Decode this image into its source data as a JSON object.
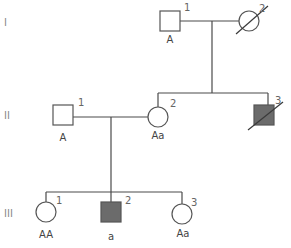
{
  "diagram": {
    "type": "pedigree",
    "generations": [
      {
        "label": "I",
        "members": [
          {
            "number": "1",
            "sex": "male",
            "affected": false,
            "deceased": false,
            "genotype": "A"
          },
          {
            "number": "2",
            "sex": "female",
            "affected": false,
            "deceased": true,
            "genotype": ""
          }
        ]
      },
      {
        "label": "II",
        "members": [
          {
            "number": "1",
            "sex": "male",
            "affected": false,
            "deceased": false,
            "genotype": "A"
          },
          {
            "number": "2",
            "sex": "female",
            "affected": false,
            "deceased": false,
            "genotype": "Aa"
          },
          {
            "number": "3",
            "sex": "male",
            "affected": true,
            "deceased": true,
            "genotype": ""
          }
        ]
      },
      {
        "label": "III",
        "members": [
          {
            "number": "1",
            "sex": "female",
            "affected": false,
            "deceased": false,
            "genotype": "AA"
          },
          {
            "number": "2",
            "sex": "male",
            "affected": true,
            "deceased": false,
            "genotype": "a"
          },
          {
            "number": "3",
            "sex": "female",
            "affected": false,
            "deceased": false,
            "genotype": "Aa"
          }
        ]
      }
    ],
    "relationships": [
      {
        "mating": [
          "I-1",
          "I-2"
        ],
        "children": [
          "II-2",
          "II-3"
        ]
      },
      {
        "mating": [
          "II-1",
          "II-2"
        ],
        "children": [
          "III-1",
          "III-2",
          "III-3"
        ]
      }
    ],
    "colors": {
      "line": "#4a4a4a",
      "affected_fill": "#6b6b6b",
      "background": "#ffffff"
    }
  }
}
